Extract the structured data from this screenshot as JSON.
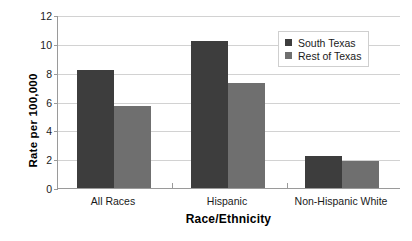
{
  "chart_data": {
    "type": "bar",
    "title": "",
    "xlabel": "Race/Ethnicity",
    "ylabel": "Rate per 100,000",
    "categories": [
      "All Races",
      "Hispanic",
      "Non-Hispanic White"
    ],
    "series": [
      {
        "name": "South Texas",
        "values": [
          8.2,
          10.2,
          2.2
        ],
        "color": "#3d3d3d"
      },
      {
        "name": "Rest of Texas",
        "values": [
          5.7,
          7.3,
          1.9
        ],
        "color": "#6f6f6f"
      }
    ],
    "ylim": [
      0,
      12
    ],
    "ytick_labels": [
      "0",
      "2",
      "4",
      "6",
      "8",
      "10",
      "12"
    ],
    "ytick_values": [
      0,
      2,
      4,
      6,
      8,
      10,
      12
    ],
    "grid": "horizontal",
    "legend_position": "top-right",
    "axis_color": "#9a9a9a",
    "grid_color": "#d2d2d2",
    "background": "#ffffff"
  },
  "legend": {
    "entries": [
      {
        "label": "South Texas"
      },
      {
        "label": "Rest of Texas"
      }
    ]
  }
}
